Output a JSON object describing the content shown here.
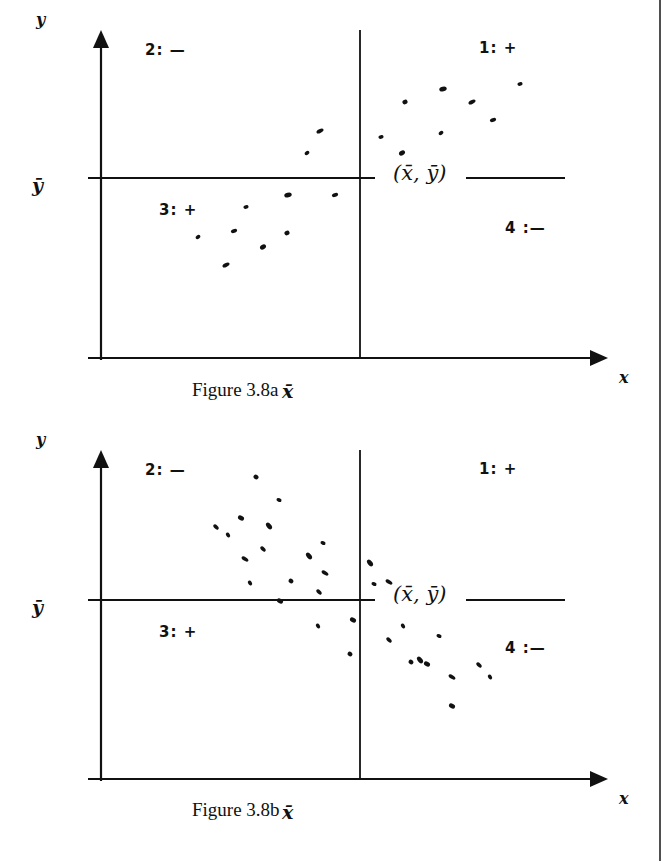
{
  "chart_data": [
    {
      "type": "scatter",
      "title": "Figure 3.8a",
      "xlabel": "x",
      "ylabel": "y",
      "mean_labels": {
        "x_mean": "x̄",
        "y_mean": "ȳ",
        "centroid": "(x̄, ȳ)"
      },
      "quadrants": [
        {
          "id": 1,
          "label": "1:",
          "sign": "+"
        },
        {
          "id": 2,
          "label": "2:",
          "sign": "—"
        },
        {
          "id": 3,
          "label": "3:",
          "sign": "+"
        },
        {
          "id": 4,
          "label": "4:",
          "sign": "—"
        }
      ],
      "relationship": "positive",
      "points_px": [
        [
          198,
          237
        ],
        [
          226,
          265
        ],
        [
          234,
          231
        ],
        [
          246,
          207
        ],
        [
          263,
          247
        ],
        [
          287,
          233
        ],
        [
          288,
          195
        ],
        [
          307,
          153
        ],
        [
          320,
          131
        ],
        [
          335,
          195
        ],
        [
          381,
          137
        ],
        [
          402,
          153
        ],
        [
          405,
          102
        ],
        [
          443,
          89
        ],
        [
          441,
          133
        ],
        [
          472,
          102
        ],
        [
          493,
          120
        ],
        [
          520,
          84
        ]
      ],
      "axes_px": {
        "origin_x": 101,
        "origin_y": 358,
        "x_mean": 360,
        "y_mean": 178,
        "x_end": 608,
        "y_end": 30
      }
    },
    {
      "type": "scatter",
      "title": "Figure 3.8b",
      "xlabel": "x",
      "ylabel": "y",
      "mean_labels": {
        "x_mean": "x̄",
        "y_mean": "ȳ",
        "centroid": "(x̄, ȳ)"
      },
      "quadrants": [
        {
          "id": 1,
          "label": "1:",
          "sign": "+"
        },
        {
          "id": 2,
          "label": "2:",
          "sign": "—"
        },
        {
          "id": 3,
          "label": "3:",
          "sign": "+"
        },
        {
          "id": 4,
          "label": "4:",
          "sign": "—"
        }
      ],
      "relationship": "negative",
      "points_px": [
        [
          216,
          527
        ],
        [
          228,
          535
        ],
        [
          241,
          518
        ],
        [
          256,
          477
        ],
        [
          269,
          526
        ],
        [
          279,
          500
        ],
        [
          245,
          559
        ],
        [
          263,
          549
        ],
        [
          250,
          583
        ],
        [
          280,
          601
        ],
        [
          291,
          581
        ],
        [
          309,
          556
        ],
        [
          323,
          543
        ],
        [
          325,
          573
        ],
        [
          319,
          592
        ],
        [
          318,
          626
        ],
        [
          353,
          620
        ],
        [
          350,
          654
        ],
        [
          370,
          563
        ],
        [
          374,
          584
        ],
        [
          389,
          582
        ],
        [
          389,
          640
        ],
        [
          403,
          626
        ],
        [
          427,
          664
        ],
        [
          411,
          662
        ],
        [
          420,
          660
        ],
        [
          439,
          636
        ],
        [
          452,
          677
        ],
        [
          479,
          665
        ],
        [
          490,
          677
        ],
        [
          452,
          706
        ]
      ],
      "axes_px": {
        "origin_x": 101,
        "origin_y": 779,
        "x_mean": 360,
        "y_mean": 600,
        "x_end": 608,
        "y_end": 450
      }
    }
  ],
  "figures": [
    {
      "caption": "Figure 3.8a",
      "y_axis_label": "y",
      "x_axis_label": "x",
      "y_mean_label": "ȳ",
      "x_mean_label": "x̄",
      "centroid_label": "(x̄, ȳ)",
      "quadrant_1": "1:  +",
      "quadrant_2": "2:  —",
      "quadrant_3": "3:  +",
      "quadrant_4": "4 :—"
    },
    {
      "caption": "Figure 3.8b",
      "y_axis_label": "y",
      "x_axis_label": "x",
      "y_mean_label": "ȳ",
      "x_mean_label": "x̄",
      "centroid_label": "(x̄, ȳ)",
      "quadrant_1": "1:  +",
      "quadrant_2": "2:  —",
      "quadrant_3": "3:  +",
      "quadrant_4": "4 :—"
    }
  ],
  "colors": {
    "ink": "#111111",
    "paper": "#ffffff"
  }
}
